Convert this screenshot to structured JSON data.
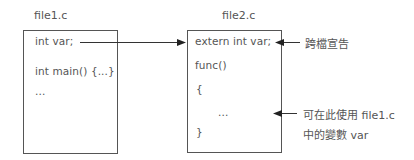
{
  "file1": {
    "title": "file1.c",
    "lines": [
      "int var;",
      "int main() {...}",
      "..."
    ]
  },
  "file2": {
    "title": "file2.c",
    "lines": [
      "extern int var;",
      "func()",
      "{",
      "...",
      "}"
    ]
  },
  "annotations": {
    "cross_file_declaration": "跨檔宣告",
    "usage_line1": "可在此使用 file1.c",
    "usage_line2": "中的變數 var"
  }
}
